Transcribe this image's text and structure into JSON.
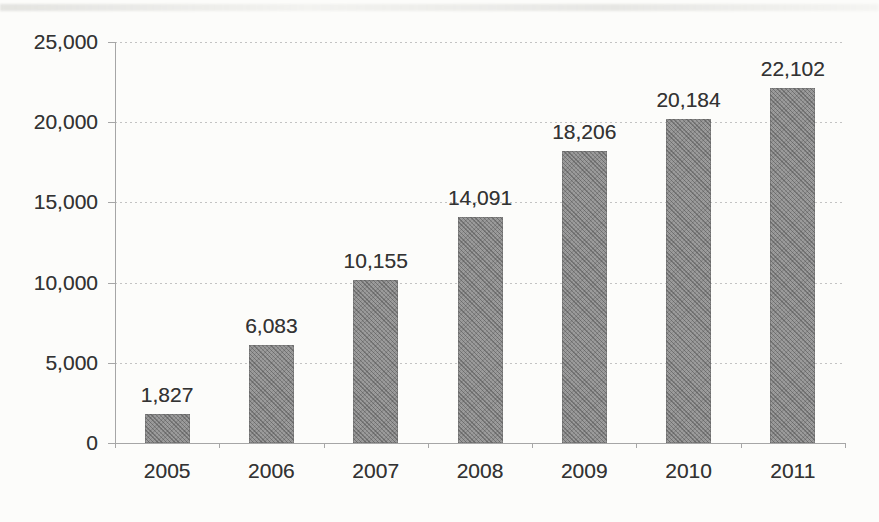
{
  "chart_data": {
    "type": "bar",
    "title": "",
    "xlabel": "",
    "ylabel": "",
    "categories": [
      "2005",
      "2006",
      "2007",
      "2008",
      "2009",
      "2010",
      "2011"
    ],
    "values": [
      1827,
      6083,
      10155,
      14091,
      18206,
      20184,
      22102
    ],
    "value_labels": [
      "1,827",
      "6,083",
      "10,155",
      "14,091",
      "18,206",
      "20,184",
      "22,102"
    ],
    "ylim": [
      0,
      25000
    ],
    "ytick_interval": 5000,
    "ytick_labels": [
      "0",
      "5,000",
      "10,000",
      "15,000",
      "20,000",
      "25,000"
    ],
    "grid": "horizontal-dotted",
    "legend_position": "none",
    "colors": {
      "bar_fill": "#8f8f8f",
      "bar_texture": "halftone-crosshatch",
      "gridline": "#c3c3c3",
      "axis": "#a6a6a6",
      "text": "#333333",
      "background": "#fcfcfa"
    }
  }
}
